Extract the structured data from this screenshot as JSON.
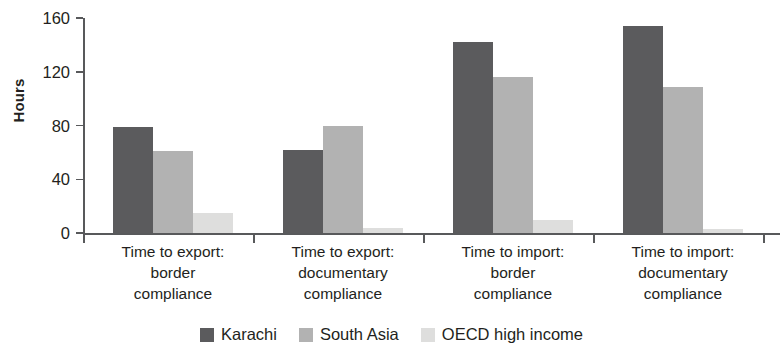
{
  "chart_data": {
    "type": "bar",
    "title": "",
    "xlabel": "",
    "ylabel": "Hours",
    "ylim": [
      0,
      160
    ],
    "yticks": [
      0,
      40,
      80,
      120,
      160
    ],
    "grid": false,
    "legend_position": "bottom-center",
    "categories": [
      "Time to export:\nborder\ncompliance",
      "Time to export:\ndocumentary\ncompliance",
      "Time to import:\nborder\ncompliance",
      "Time to import:\ndocumentary\ncompliance"
    ],
    "category_lines": [
      [
        "Time to export:",
        "border",
        "compliance"
      ],
      [
        "Time to export:",
        "documentary",
        "compliance"
      ],
      [
        "Time to import:",
        "border",
        "compliance"
      ],
      [
        "Time to import:",
        "documentary",
        "compliance"
      ]
    ],
    "series": [
      {
        "name": "Karachi",
        "color": "#5b5b5d",
        "values": [
          79,
          62,
          142,
          154
        ]
      },
      {
        "name": "South Asia",
        "color": "#b2b2b2",
        "values": [
          61,
          80,
          116,
          109
        ]
      },
      {
        "name": "OECD high income",
        "color": "#dededd",
        "values": [
          15,
          4,
          10,
          3
        ]
      }
    ]
  },
  "axis": {
    "y_title": "Hours",
    "tick_labels": [
      "160",
      "120",
      "80",
      "40",
      "0"
    ]
  },
  "legend": {
    "items": [
      {
        "label": "Karachi"
      },
      {
        "label": "South Asia"
      },
      {
        "label": "OECD high income"
      }
    ]
  }
}
